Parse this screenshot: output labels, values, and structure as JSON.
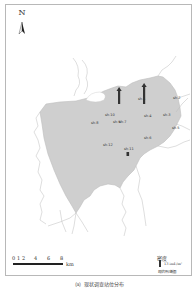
{
  "map": {
    "north_label": "N",
    "fill_color": "#cfcfcf",
    "outline_color": "#bdbdbd",
    "sites": [
      {
        "label": "sh-1",
        "x": 106,
        "y": 96
      },
      {
        "label": "sh-2",
        "x": 175,
        "y": 98
      },
      {
        "label": "sh-3",
        "x": 166,
        "y": 115
      },
      {
        "label": "sh-4",
        "x": 145,
        "y": 116
      },
      {
        "label": "sh-5",
        "x": 173,
        "y": 128
      },
      {
        "label": "sh-6",
        "x": 143,
        "y": 138
      },
      {
        "label": "sh-7",
        "x": 121,
        "y": 122
      },
      {
        "label": "sh-8",
        "x": 76,
        "y": 116
      },
      {
        "label": "sh-9",
        "x": 94,
        "y": 113
      },
      {
        "label": "sh-10",
        "x": 107,
        "y": 113
      },
      {
        "label": "sh-11",
        "x": 104,
        "y": 151
      },
      {
        "label": "sh-12",
        "x": 78,
        "y": 141
      },
      {
        "label": "sh-13",
        "x": 190,
        "y": 112
      }
    ],
    "density_bars": [
      {
        "site": "sh-1",
        "height": 14,
        "x": 118,
        "y": 90
      },
      {
        "site": "sh-2",
        "height": 18,
        "x": 143,
        "y": 86
      },
      {
        "site": "sh-11",
        "height": 4,
        "x": 127,
        "y": 152
      }
    ]
  },
  "scale_bar": {
    "ticks": [
      "0",
      "1",
      "2",
      "4",
      "6",
      "8"
    ],
    "unit": "km"
  },
  "legend": {
    "title": "密度",
    "value": "13 ind./m²",
    "note": "现状评价断面"
  },
  "caption": "（a）现状调查站位分布"
}
